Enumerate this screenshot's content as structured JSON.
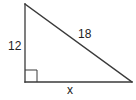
{
  "figure": {
    "type": "right-triangle",
    "vertices": {
      "top": [
        25,
        4
      ],
      "right_angle": [
        25,
        82
      ],
      "right": [
        132,
        82
      ]
    },
    "right_angle_marker_size": 12,
    "stroke_color": "#3a3a3a",
    "text_color": "#222222"
  },
  "labels": {
    "vertical_leg": "12",
    "hypotenuse": "18",
    "horizontal_leg": "x"
  }
}
